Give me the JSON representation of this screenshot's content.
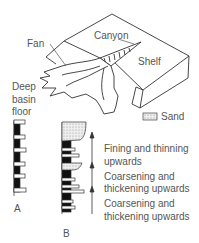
{
  "diagram": {
    "labels": {
      "canyon": "Canyon",
      "fan": "Fan",
      "shelf": "Shelf",
      "deep_basin_floor": [
        "Deep",
        "basin",
        "floor"
      ],
      "legend_sand": "Sand",
      "column_a": "A",
      "column_b": "B"
    },
    "sequences": [
      {
        "line1": "Fining and thinning",
        "line2": "upwards"
      },
      {
        "line1": "Coarsening and",
        "line2": "thickening upwards"
      },
      {
        "line1": "Coarsening and",
        "line2": "thickening upwards"
      }
    ],
    "colors": {
      "line": "#333333",
      "text": "#555555",
      "mud": "#111111",
      "sand_fill": "#e6e6e6"
    }
  }
}
